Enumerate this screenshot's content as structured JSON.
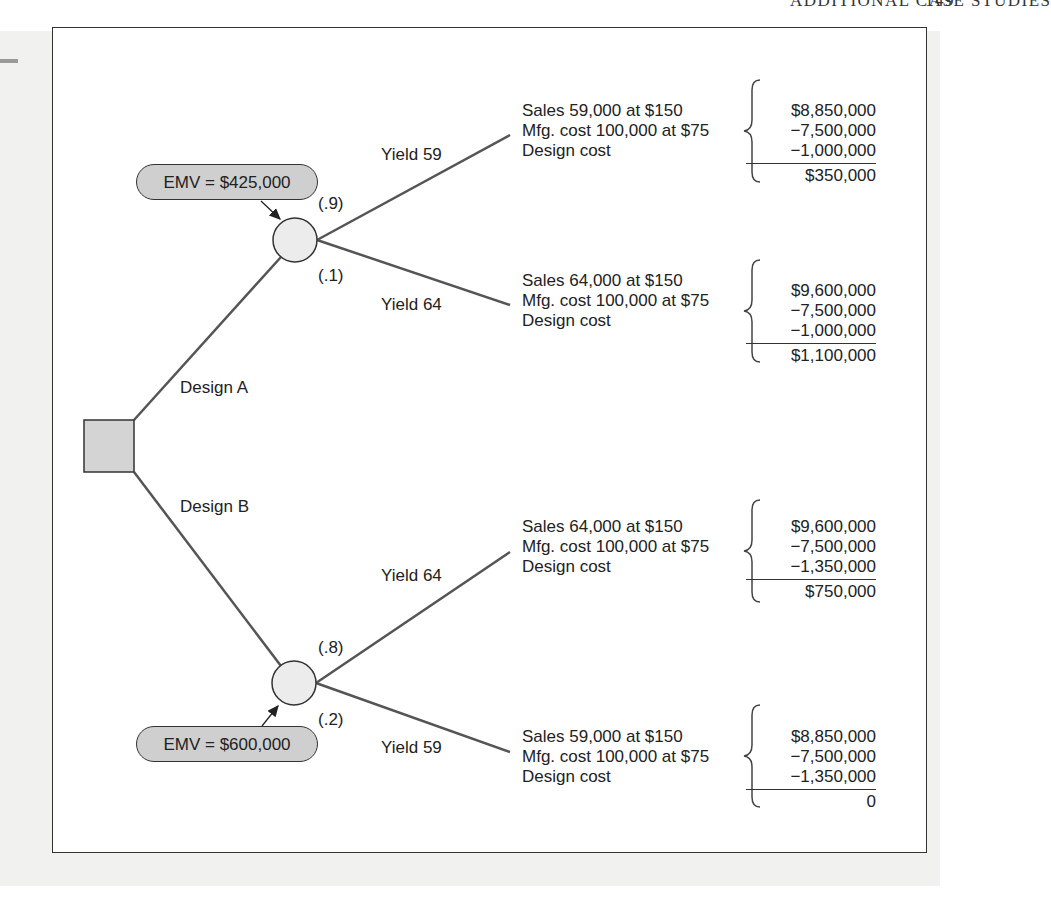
{
  "running_head": {
    "title": "ADDITIONAL CASE STUDIES",
    "page": "149"
  },
  "decision_node": {
    "shape": "square",
    "fill": "#d4d4d4"
  },
  "branches": {
    "design_a": {
      "label": "Design A"
    },
    "design_b": {
      "label": "Design B"
    }
  },
  "chance_a": {
    "emv": "EMV = $425,000",
    "prob_top": "(.9)",
    "prob_bottom": "(.1)",
    "outcomes": [
      {
        "yield": "Yield 59",
        "lines": [
          "Sales 59,000 at $150",
          "Mfg. cost 100,000 at $75",
          "Design cost"
        ],
        "values": [
          "$8,850,000",
          "−7,500,000",
          "−1,000,000"
        ],
        "result": "$350,000"
      },
      {
        "yield": "Yield 64",
        "lines": [
          "Sales 64,000 at $150",
          "Mfg. cost 100,000 at $75",
          "Design cost"
        ],
        "values": [
          "$9,600,000",
          "−7,500,000",
          "−1,000,000"
        ],
        "result": "$1,100,000"
      }
    ]
  },
  "chance_b": {
    "emv": "EMV = $600,000",
    "prob_top": "(.8)",
    "prob_bottom": "(.2)",
    "outcomes": [
      {
        "yield": "Yield 64",
        "lines": [
          "Sales 64,000 at $150",
          "Mfg. cost 100,000 at $75",
          "Design cost"
        ],
        "values": [
          "$9,600,000",
          "−7,500,000",
          "−1,350,000"
        ],
        "result": "$750,000"
      },
      {
        "yield": "Yield 59",
        "lines": [
          "Sales 59,000 at $150",
          "Mfg. cost 100,000 at $75",
          "Design cost"
        ],
        "values": [
          "$8,850,000",
          "−7,500,000",
          "−1,350,000"
        ],
        "result": "0"
      }
    ]
  },
  "colors": {
    "line": "#555555",
    "node_fill": "#ececec",
    "pill_fill": "#cfcfcf",
    "frame": "#333333"
  }
}
